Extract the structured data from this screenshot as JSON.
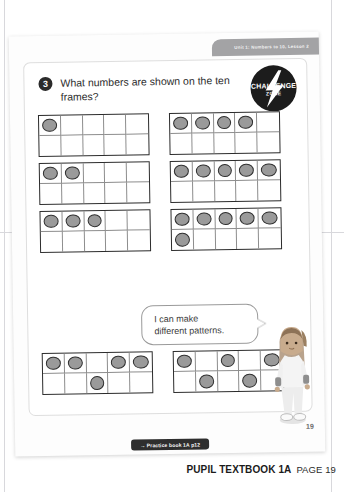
{
  "page": {
    "unit_tab": "Unit 1: Numbers to 10, Lesson 2",
    "sheet_page_number": "19"
  },
  "challenge_badge": {
    "line1": "CHALLENGE",
    "line2": "ZONE",
    "icon": "lightning-bolt-icon"
  },
  "question": {
    "number": "3",
    "text": "What numbers are shown on the ten frames?"
  },
  "ten_frames": [
    {
      "id": "frame-a",
      "count": 1,
      "filled": [
        1,
        0,
        0,
        0,
        0,
        0,
        0,
        0,
        0,
        0
      ]
    },
    {
      "id": "frame-b",
      "count": 4,
      "filled": [
        1,
        1,
        1,
        1,
        0,
        0,
        0,
        0,
        0,
        0
      ]
    },
    {
      "id": "frame-c",
      "count": 2,
      "filled": [
        1,
        1,
        0,
        0,
        0,
        0,
        0,
        0,
        0,
        0
      ]
    },
    {
      "id": "frame-d",
      "count": 5,
      "filled": [
        1,
        1,
        1,
        1,
        1,
        0,
        0,
        0,
        0,
        0
      ]
    },
    {
      "id": "frame-e",
      "count": 3,
      "filled": [
        1,
        1,
        1,
        0,
        0,
        0,
        0,
        0,
        0,
        0
      ]
    },
    {
      "id": "frame-f",
      "count": 6,
      "filled": [
        1,
        1,
        1,
        1,
        1,
        1,
        0,
        0,
        0,
        0
      ]
    },
    {
      "id": "frame-g",
      "count": 5,
      "filled": [
        1,
        1,
        0,
        1,
        1,
        0,
        0,
        1,
        0,
        0
      ]
    },
    {
      "id": "frame-h",
      "count": 5,
      "filled": [
        1,
        0,
        1,
        0,
        1,
        0,
        1,
        0,
        1,
        0
      ]
    }
  ],
  "speech_bubble": {
    "line1": "I can make",
    "line2": "different patterns."
  },
  "character": {
    "name": "girl-character"
  },
  "practice_tab": {
    "label": "→ Practice book 1A p12"
  },
  "footer": {
    "title": "PUPIL TEXTBOOK 1A",
    "page_label": "PAGE 19"
  },
  "colors": {
    "counter_fill": "#9a9a9a",
    "counter_stroke": "#2e2e2e",
    "frame_stroke": "#2c2c2c",
    "unit_tab_bg": "#a3a3a5",
    "badge_bg": "#1c1c1c"
  }
}
